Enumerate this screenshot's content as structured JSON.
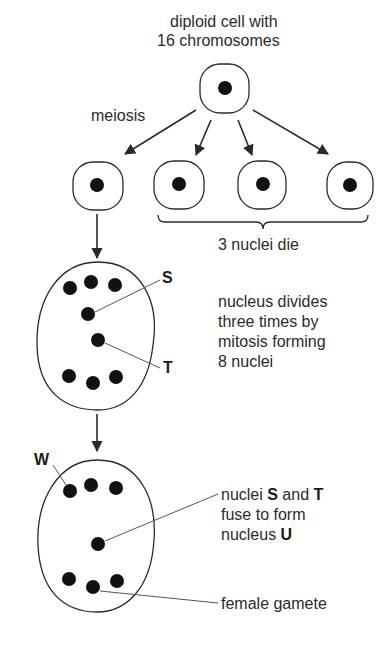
{
  "diagram": {
    "title_line1": "diploid cell with",
    "title_line2": "16 chromosomes",
    "meiosis_label": "meiosis",
    "die_label": "3 nuclei die",
    "mitosis_text": [
      "nucleus divides",
      "three times by",
      "mitosis forming",
      "8 nuclei"
    ],
    "fuse_text": {
      "line1_pre": "nuclei ",
      "line1_s": "S",
      "line1_mid": " and ",
      "line1_t": "T",
      "line2": "fuse to form",
      "line3_pre": "nucleus ",
      "line3_u": "U"
    },
    "gamete_label": "female gamete",
    "letters": {
      "s": "S",
      "t": "T",
      "w": "W"
    },
    "colors": {
      "line": "#2a2a2a",
      "nucleus": "#111111",
      "text": "#2b2b2b"
    }
  }
}
